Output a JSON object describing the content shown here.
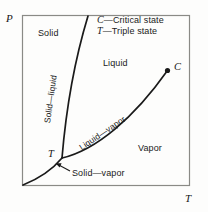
{
  "diagram": {
    "type": "phase-diagram",
    "axes": {
      "y_label": "P",
      "x_label": "T"
    },
    "regions": [
      {
        "name": "solid",
        "label": "Solid"
      },
      {
        "name": "liquid",
        "label": "Liquid"
      },
      {
        "name": "vapor",
        "label": "Vapor"
      }
    ],
    "curves": [
      {
        "name": "fusion",
        "label": "Solid—liquid"
      },
      {
        "name": "vaporization",
        "label": "Liquid—vapor"
      },
      {
        "name": "sublimation",
        "label": "Solid—vapor"
      }
    ],
    "points": [
      {
        "name": "critical-point",
        "label": "C"
      },
      {
        "name": "triple-point",
        "label": "T"
      }
    ],
    "legend": [
      {
        "symbol": "C",
        "dash": "—",
        "text": "Critical state"
      },
      {
        "symbol": "T",
        "dash": "—",
        "text": "Triple state"
      }
    ],
    "colors": {
      "ink": "#1a1a1a",
      "frame": "#8a8a86",
      "background": "#fdfdfc"
    }
  }
}
